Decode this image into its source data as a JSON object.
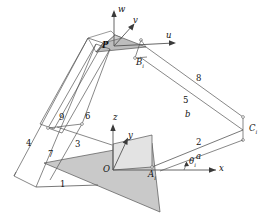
{
  "figure": {
    "colors": {
      "line": "#555555",
      "base_triangle_fill": "#c9c9c9",
      "panel_fill": "#e3e3e3",
      "platform_fill": "#bdbdbd",
      "text": "#111111",
      "background": "#ffffff"
    }
  },
  "axes": {
    "base_frame": {
      "origin_label": "O",
      "x_label": "x",
      "y_label": "y",
      "z_label": "z"
    },
    "platform_frame": {
      "origin_label": "P",
      "u_label": "u",
      "v_label": "v",
      "w_label": "w"
    }
  },
  "joints": [
    {
      "name": "A",
      "label": "A",
      "subscript": "i"
    },
    {
      "name": "B",
      "label": "B",
      "subscript": "i"
    },
    {
      "name": "C",
      "label": "C",
      "subscript": "i"
    }
  ],
  "dimensions": [
    {
      "name": "a",
      "label": "a"
    },
    {
      "name": "b",
      "label": "b"
    },
    {
      "name": "theta",
      "label": "θ",
      "subscript": "i"
    }
  ],
  "link_numbers": [
    "1",
    "2",
    "3",
    "4",
    "5",
    "6",
    "7",
    "8",
    "9"
  ]
}
